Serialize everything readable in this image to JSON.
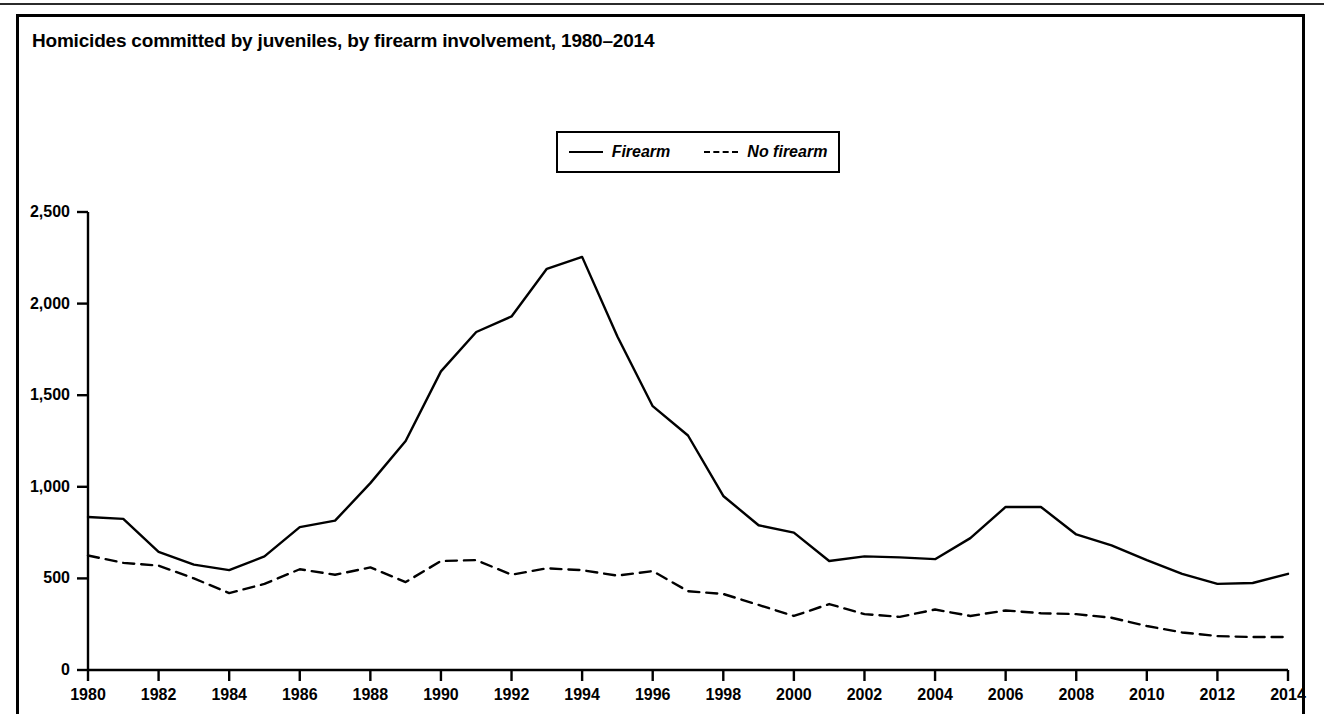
{
  "figure": {
    "title": "Homicides committed by juveniles, by firearm involvement, 1980–2014"
  },
  "legend": {
    "position": "top-center",
    "items": [
      {
        "label": "Firearm",
        "style": "solid"
      },
      {
        "label": "No firearm",
        "style": "dashed"
      }
    ]
  },
  "axes": {
    "y_ticks": [
      "0",
      "500",
      "1,000",
      "1,500",
      "2,000",
      "2,500"
    ],
    "x_ticks": [
      "1980",
      "1982",
      "1984",
      "1986",
      "1988",
      "1990",
      "1992",
      "1994",
      "1996",
      "1998",
      "2000",
      "2002",
      "2004",
      "2006",
      "2008",
      "2010",
      "2012",
      "2014"
    ]
  },
  "chart_data": {
    "type": "line",
    "title": "Homicides committed by juveniles, by firearm involvement, 1980–2014",
    "xlabel": "",
    "ylabel": "",
    "xlim": [
      1980,
      2014
    ],
    "ylim": [
      0,
      2500
    ],
    "grid": false,
    "legend_position": "top-center",
    "x": [
      1980,
      1981,
      1982,
      1983,
      1984,
      1985,
      1986,
      1987,
      1988,
      1989,
      1990,
      1991,
      1992,
      1993,
      1994,
      1995,
      1996,
      1997,
      1998,
      1999,
      2000,
      2001,
      2002,
      2003,
      2004,
      2005,
      2006,
      2007,
      2008,
      2009,
      2010,
      2011,
      2012,
      2013,
      2014
    ],
    "series": [
      {
        "name": "Firearm",
        "style": "solid",
        "color": "#000000",
        "values": [
          835,
          825,
          645,
          575,
          545,
          620,
          780,
          815,
          1020,
          1250,
          1630,
          1845,
          1930,
          2190,
          2255,
          1820,
          1440,
          1280,
          950,
          790,
          750,
          595,
          620,
          615,
          605,
          720,
          890,
          890,
          740,
          680,
          600,
          525,
          470,
          475,
          525
        ]
      },
      {
        "name": "No firearm",
        "style": "dashed",
        "color": "#000000",
        "values": [
          625,
          585,
          570,
          500,
          420,
          470,
          550,
          520,
          560,
          480,
          595,
          600,
          520,
          555,
          545,
          515,
          540,
          430,
          415,
          355,
          295,
          360,
          305,
          290,
          330,
          295,
          325,
          310,
          305,
          285,
          240,
          205,
          185,
          180,
          180
        ]
      }
    ]
  }
}
